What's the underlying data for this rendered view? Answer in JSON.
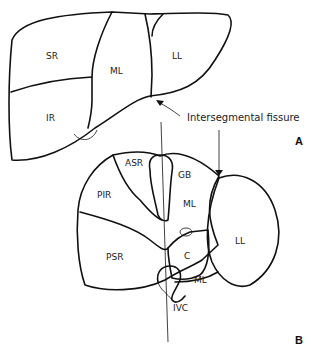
{
  "figure": {
    "panel_a": {
      "label": "A",
      "segments": [
        "SR",
        "ML",
        "LL",
        "IR"
      ],
      "annotation": "Intersegmental fissure"
    },
    "panel_b": {
      "label": "B",
      "segments": [
        "ASR",
        "GB",
        "PIR",
        "ML",
        "LL",
        "C",
        "PSR",
        "ML",
        "IVC"
      ]
    }
  }
}
